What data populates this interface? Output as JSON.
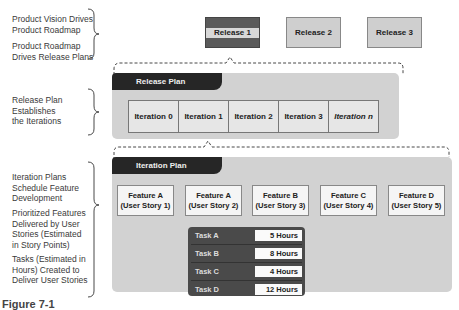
{
  "left_labels": {
    "vision": [
      "Product Vision Drives",
      "Product Roadmap"
    ],
    "roadmap": [
      "Product Roadmap",
      "Drives Release Plans"
    ],
    "release_plan": [
      "Release Plan",
      "Establishes",
      "the Iterations"
    ],
    "iteration_plans": [
      "Iteration Plans",
      "Schedule Feature",
      "Development"
    ],
    "features": [
      "Prioritized Features",
      "Delivered by User",
      "Stories (Estimated",
      "in Story Points)"
    ],
    "tasks": [
      "Tasks (Estimated in",
      "Hours) Created to",
      "Deliver User Stories"
    ]
  },
  "releases": [
    {
      "label": "Release 1",
      "selected": true
    },
    {
      "label": "Release 2",
      "selected": false
    },
    {
      "label": "Release 3",
      "selected": false
    }
  ],
  "release_plan": {
    "title": "Release Plan",
    "iterations": [
      "Iteration 0",
      "Iteration 1",
      "Iteration 2",
      "Iteration 3",
      "Iteration n"
    ]
  },
  "iteration_plan": {
    "title": "Iteration Plan",
    "features": [
      {
        "name": "Feature A",
        "story": "(User Story 1)"
      },
      {
        "name": "Feature A",
        "story": "(User Story 2)"
      },
      {
        "name": "Feature B",
        "story": "(User Story 3)"
      },
      {
        "name": "Feature C",
        "story": "(User Story 4)"
      },
      {
        "name": "Feature D",
        "story": "(User Story 5)"
      }
    ],
    "tasks": [
      {
        "name": "Task A",
        "hours": "5 Hours"
      },
      {
        "name": "Task B",
        "hours": "8 Hours"
      },
      {
        "name": "Task C",
        "hours": "4 Hours"
      },
      {
        "name": "Task D",
        "hours": "12 Hours"
      }
    ]
  },
  "caption": "Figure 7-1",
  "colors": {
    "panel": "#d2d2d2",
    "tab": "#262626",
    "release_selected": "#5a5a5a",
    "release_default": "#cfcfcf",
    "task_panel": "#4a4a4a"
  }
}
